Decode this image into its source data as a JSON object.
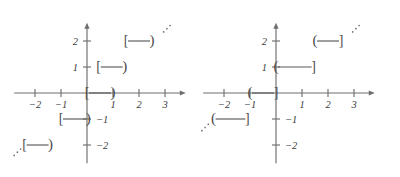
{
  "figure": {
    "panel_count": 2
  },
  "chart_data": [
    {
      "type": "line",
      "name": "left-plot",
      "title": "",
      "xlabel": "",
      "ylabel": "",
      "xlim": [
        -2.8,
        3.8
      ],
      "ylim": [
        -2.7,
        2.7
      ],
      "grid": false,
      "legend": null,
      "origin_px": {
        "x": 87,
        "y": 93
      },
      "unit_px": 26,
      "x_ticks": [
        -2,
        -1,
        1,
        2,
        3
      ],
      "x_tick_labels": [
        "-2",
        "-1",
        "1",
        "2",
        "3"
      ],
      "y_ticks": [
        2,
        1,
        -1,
        -2
      ],
      "y_tick_labels": [
        "2",
        "1",
        "-1",
        "-2"
      ],
      "interval_style": "left-closed-right-open",
      "left_bracket": "[",
      "right_bracket": ")",
      "segments": [
        {
          "y": 2,
          "x_start": 1.5,
          "x_end": 2.5,
          "left_closed": true,
          "right_closed": false
        },
        {
          "y": 1,
          "x_start": 0.45,
          "x_end": 1.45,
          "left_closed": true,
          "right_closed": false
        },
        {
          "y": 0,
          "x_start": 0.0,
          "x_end": 1.0,
          "left_closed": true,
          "right_closed": false
        },
        {
          "y": -1,
          "x_start": -1.0,
          "x_end": 0.05,
          "left_closed": true,
          "right_closed": false
        },
        {
          "y": -2,
          "x_start": -2.4,
          "x_end": -1.4,
          "left_closed": true,
          "right_closed": false
        }
      ],
      "ellipses": [
        {
          "at_x": 2.95,
          "at_y": 2.35,
          "direction": "up-right"
        },
        {
          "at_x": -2.8,
          "at_y": -2.4,
          "direction": "down-left"
        }
      ]
    },
    {
      "type": "line",
      "name": "right-plot",
      "title": "",
      "xlabel": "",
      "ylabel": "",
      "xlim": [
        -2.8,
        3.8
      ],
      "ylim": [
        -2.7,
        2.7
      ],
      "grid": false,
      "legend": null,
      "origin_px": {
        "x": 76,
        "y": 93
      },
      "unit_px": 26,
      "x_ticks": [
        -2,
        -1,
        1,
        2,
        3
      ],
      "x_tick_labels": [
        "-2",
        "-1",
        "1",
        "2",
        "3"
      ],
      "y_ticks": [
        2,
        1,
        -1,
        -2
      ],
      "y_tick_labels": [
        "2",
        "1",
        "-1",
        "-2"
      ],
      "interval_style": "left-open-right-closed",
      "left_bracket": "(",
      "right_bracket": "]",
      "segments": [
        {
          "y": 2,
          "x_start": 1.5,
          "x_end": 2.5,
          "left_closed": false,
          "right_closed": true
        },
        {
          "y": 1,
          "x_start": 0.0,
          "x_end": 1.45,
          "left_closed": false,
          "right_closed": true
        },
        {
          "y": 0,
          "x_start": -1.0,
          "x_end": 0.0,
          "left_closed": false,
          "right_closed": true
        },
        {
          "y": -1,
          "x_start": -2.4,
          "x_end": -1.1,
          "left_closed": false,
          "right_closed": true
        }
      ],
      "ellipses": [
        {
          "at_x": 2.95,
          "at_y": 2.35,
          "direction": "up-right"
        },
        {
          "at_x": -2.85,
          "at_y": -1.45,
          "direction": "down-left"
        }
      ]
    }
  ]
}
